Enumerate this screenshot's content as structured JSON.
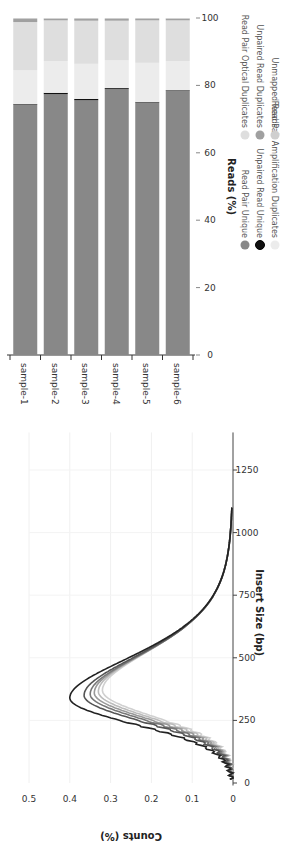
{
  "chart_data": [
    {
      "type": "bar",
      "orientation": "vertical stacked (image rotated 90°)",
      "title": "",
      "categories": [
        "sample-1",
        "sample-2",
        "sample-3",
        "sample-4",
        "sample-5",
        "sample-6"
      ],
      "xlabel": "",
      "ylabel": "Reads (%)",
      "ylim": [
        0,
        100
      ],
      "yticks": [
        0,
        20,
        40,
        60,
        80,
        100
      ],
      "grid": false,
      "series": [
        {
          "name": "Read Pair Unique",
          "color": "#888888",
          "values": [
            74.4,
            77.4,
            75.6,
            78.9,
            75.0,
            78.5
          ]
        },
        {
          "name": "Unpaired Read Unique",
          "color": "#111111",
          "values": [
            0.1,
            0.4,
            0.4,
            0.3,
            0.1,
            0.1
          ]
        },
        {
          "name": "Read Pair Amplification Duplicates",
          "color": "#ececec",
          "values": [
            10.0,
            9.4,
            10.4,
            8.2,
            11.6,
            8.6
          ]
        },
        {
          "name": "Read Pair Optical Duplicates",
          "color": "#dedede",
          "values": [
            14.3,
            12.1,
            12.8,
            11.8,
            12.6,
            12.1
          ]
        },
        {
          "name": "Unpaired Read Duplicates",
          "color": "#a0a0a0",
          "values": [
            0.9,
            0.5,
            0.5,
            0.5,
            0.4,
            0.5
          ]
        },
        {
          "name": "Unmapped Reads",
          "color": "#cfcfcf",
          "values": [
            0.3,
            0.2,
            0.3,
            0.3,
            0.3,
            0.2
          ]
        }
      ],
      "legend_position": "bottom"
    },
    {
      "type": "line",
      "title": "",
      "xlabel": "Insert Size (bp)",
      "ylabel": "Counts (%)",
      "xlim": [
        0,
        1400
      ],
      "ylim": [
        0,
        0.5
      ],
      "xticks": [
        0,
        250,
        500,
        750,
        1000,
        1250
      ],
      "yticks": [
        0,
        0.1,
        0.2,
        0.3,
        0.4,
        0.5
      ],
      "grid": true,
      "series": [
        {
          "name": "sample-1",
          "color": "#222222",
          "peak_x": 340,
          "peak_y": 0.4
        },
        {
          "name": "sample-2",
          "color": "#555555",
          "peak_x": 350,
          "peak_y": 0.365
        },
        {
          "name": "sample-3",
          "color": "#777777",
          "peak_x": 355,
          "peak_y": 0.35
        },
        {
          "name": "sample-4",
          "color": "#999999",
          "peak_x": 360,
          "peak_y": 0.34
        },
        {
          "name": "sample-5",
          "color": "#bbbbbb",
          "peak_x": 365,
          "peak_y": 0.33
        },
        {
          "name": "sample-6",
          "color": "#d0d0d0",
          "peak_x": 370,
          "peak_y": 0.32
        }
      ]
    }
  ],
  "labels": {
    "bar_ylabel": "Reads (%)",
    "line_xlabel": "Insert Size (bp)",
    "line_ylabel": "Counts (%)"
  }
}
